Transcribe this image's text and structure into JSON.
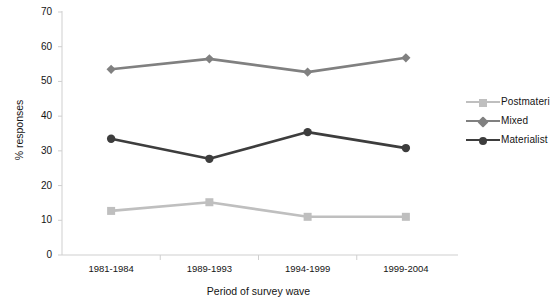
{
  "chart_data": {
    "type": "line",
    "title": "",
    "subtitle": "",
    "xlabel": "Period of survey wave",
    "ylabel": "% responses",
    "categories": [
      "1981-1984",
      "1989-1993",
      "1994-1999",
      "1999-2004"
    ],
    "ylim": [
      0,
      70
    ],
    "ytick_step": 10,
    "yticks": [
      "0",
      "10",
      "20",
      "30",
      "40",
      "50",
      "60",
      "70"
    ],
    "grid": false,
    "legend_position": "right",
    "series": [
      {
        "name": "Postmateri",
        "full_name": "Postmaterialist",
        "color": "#bfbfbf",
        "marker": "square",
        "values": [
          12.7,
          15.2,
          11.0,
          11.0
        ]
      },
      {
        "name": "Mixed",
        "full_name": "Mixed",
        "color": "#808080",
        "marker": "diamond",
        "values": [
          53.5,
          56.5,
          52.7,
          56.8
        ]
      },
      {
        "name": "Materialist",
        "full_name": "Materialist",
        "color": "#3d3d3d",
        "marker": "circle",
        "values": [
          33.5,
          27.7,
          35.4,
          30.8
        ]
      }
    ],
    "axis_color": "#cfcfcf",
    "text_color": "#141414"
  }
}
